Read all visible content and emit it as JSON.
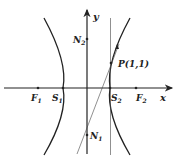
{
  "diagram": {
    "title": "",
    "axes": {
      "x_label": "x",
      "y_label": "y"
    },
    "points": {
      "F1": {
        "name": "F",
        "sub": "1"
      },
      "F2": {
        "name": "F",
        "sub": "2"
      },
      "S1": {
        "name": "S",
        "sub": "1"
      },
      "S2": {
        "name": "S",
        "sub": "2"
      },
      "N1": {
        "name": "N",
        "sub": "1"
      },
      "N2": {
        "name": "N",
        "sub": "2"
      },
      "P": {
        "label": "P(1,1)"
      }
    },
    "elements": [
      "hyperbola left branch through S1",
      "hyperbola right branch through S2 and P(1,1)",
      "vertical line through S2",
      "line through N1 and P(1,1)"
    ],
    "colors": {
      "ink": "#222222",
      "background": "#ffffff"
    }
  }
}
